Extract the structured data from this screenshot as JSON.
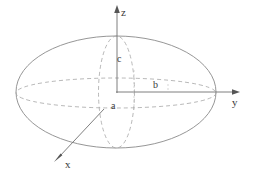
{
  "figure": {
    "title": "",
    "axes": [
      {
        "name": "z-axis",
        "label": "z",
        "direction": "up"
      },
      {
        "name": "y-axis",
        "label": "y",
        "direction": "right"
      },
      {
        "name": "x-axis",
        "label": "x",
        "direction": "down-left"
      }
    ],
    "dimensions": [
      {
        "name": "semi-axis-a",
        "label": "a",
        "along": "x"
      },
      {
        "name": "semi-axis-b",
        "label": "b",
        "along": "y"
      },
      {
        "name": "semi-axis-c",
        "label": "c",
        "along": "z"
      }
    ],
    "colors": {
      "stroke": "#808080",
      "axis": "#707070",
      "text": "#3a3a3a",
      "background": "#ffffff"
    },
    "geometry": {
      "center": {
        "x": 116,
        "y": 92
      },
      "outer_ellipse": {
        "rx": 100,
        "ry": 56
      },
      "equator_ellipse": {
        "rx": 100,
        "ry": 15
      },
      "meridian_ellipse": {
        "rx": 18,
        "ry": 56
      },
      "z_axis_tip": {
        "x": 117,
        "y": 6
      },
      "y_axis_tip": {
        "x": 240,
        "y": 92
      },
      "x_axis_tip": {
        "x": 54,
        "y": 162
      }
    }
  }
}
